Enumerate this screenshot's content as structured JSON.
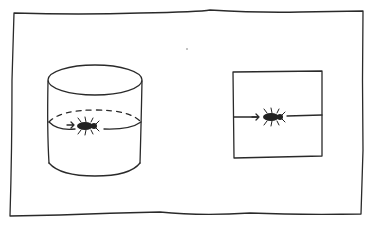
{
  "figure": {
    "colors": {
      "ink": "#2a2a2a",
      "paper": "#ffffff"
    },
    "frame": {
      "x": 14,
      "y": 12,
      "width": 349,
      "height": 205
    },
    "cylinder": {
      "cx": 95,
      "top_y": 80,
      "rx": 47,
      "ry": 15,
      "bottom_y": 175,
      "band_y": 127,
      "back_arc": "dashed",
      "insect": {
        "x": 83,
        "y": 125,
        "heading": "right",
        "icon": "insect-icon"
      },
      "arrow": {
        "from_x": 67,
        "to_x": 73,
        "y": 125
      }
    },
    "square": {
      "x": 233,
      "y": 71,
      "width": 89,
      "height": 86,
      "line_y": 117,
      "insect": {
        "x": 272,
        "y": 117,
        "heading": "right",
        "icon": "insect-icon"
      },
      "arrow": {
        "from_x": 250,
        "to_x": 259,
        "y": 117
      }
    },
    "stray_mark": {
      "x": 187,
      "y": 49
    }
  }
}
